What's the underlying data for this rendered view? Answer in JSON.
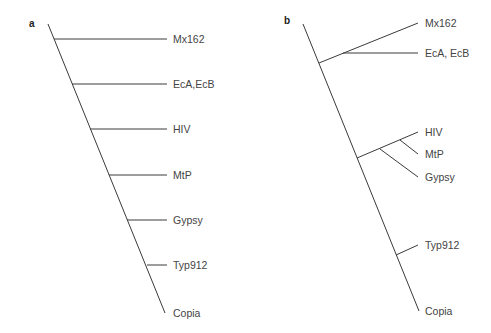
{
  "figure": {
    "panels": [
      {
        "id": "a",
        "label": "a",
        "type": "cladogram",
        "description": "Ladder tree; each taxon branches sequentially from a single trunk",
        "taxa": [
          "Mx162",
          "EcA,EcB",
          "HIV",
          "MtP",
          "Gypsy",
          "Typ912",
          "Copia"
        ],
        "topology": "(Mx162,(EcA_EcB,(HIV,(MtP,(Gypsy,(Typ912,Copia))))))"
      },
      {
        "id": "b",
        "label": "b",
        "type": "cladogram",
        "description": "Tree with grouped clades",
        "taxa": [
          "Mx162",
          "EcA, EcB",
          "HIV",
          "MtP",
          "Gypsy",
          "Typ912",
          "Copia"
        ],
        "topology": "((Mx162,EcA_EcB),((HIV,MtP),Gypsy),(Typ912,Copia))",
        "clades": [
          {
            "members": [
              "Mx162",
              "EcA, EcB"
            ]
          },
          {
            "members": [
              "HIV",
              "MtP",
              "Gypsy"
            ],
            "subclade": [
              "HIV",
              "MtP"
            ]
          },
          {
            "members": [
              "Typ912",
              "Copia"
            ]
          }
        ]
      }
    ]
  }
}
